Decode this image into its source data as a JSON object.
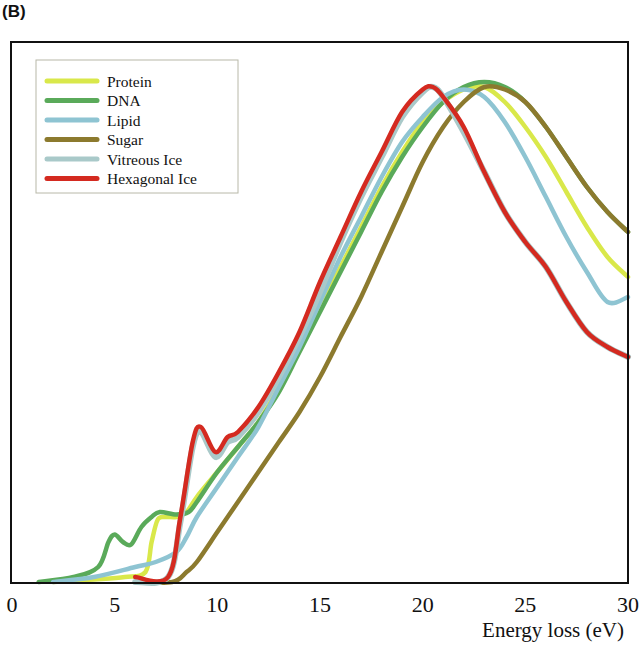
{
  "panel_label": "(B)",
  "chart_data": {
    "type": "line",
    "title": "",
    "xlabel": "Energy loss (eV)",
    "ylabel": "",
    "xlim": [
      0,
      30
    ],
    "ylim": [
      0,
      1.08
    ],
    "xticks": [
      0,
      5,
      10,
      15,
      20,
      25,
      30
    ],
    "xtick_labels": [
      "0",
      "5",
      "10",
      "15",
      "20",
      "25",
      "30"
    ],
    "yticks_shown": false,
    "grid": false,
    "legend_position": "upper left",
    "series": [
      {
        "name": "Protein",
        "color": "#d9e84a",
        "x": [
          2.0,
          4.0,
          5.5,
          6.5,
          6.8,
          7.1,
          7.5,
          8.0,
          8.5,
          9.0,
          10.0,
          11.0,
          12.0,
          13.0,
          14.0,
          15.0,
          16.0,
          17.0,
          18.0,
          19.0,
          20.0,
          21.0,
          22.0,
          23.0,
          24.0,
          25.0,
          26.0,
          27.0,
          28.0,
          29.0,
          30.0
        ],
        "y": [
          0.0,
          0.005,
          0.01,
          0.02,
          0.08,
          0.125,
          0.13,
          0.13,
          0.14,
          0.17,
          0.22,
          0.27,
          0.32,
          0.39,
          0.47,
          0.55,
          0.63,
          0.71,
          0.79,
          0.86,
          0.92,
          0.96,
          0.985,
          0.99,
          0.96,
          0.91,
          0.85,
          0.78,
          0.71,
          0.65,
          0.61
        ]
      },
      {
        "name": "DNA",
        "color": "#5aaa5a",
        "x": [
          1.3,
          3.0,
          4.2,
          4.7,
          5.0,
          5.4,
          5.8,
          6.3,
          6.8,
          7.2,
          8.0,
          8.6,
          9.0,
          10.0,
          11.0,
          12.0,
          13.0,
          14.0,
          15.0,
          16.0,
          17.0,
          18.0,
          19.0,
          20.0,
          21.0,
          22.0,
          23.0,
          24.0,
          25.0,
          26.0,
          27.0,
          28.0,
          29.0,
          30.0
        ],
        "y": [
          0.0,
          0.01,
          0.03,
          0.08,
          0.095,
          0.08,
          0.075,
          0.11,
          0.13,
          0.14,
          0.135,
          0.14,
          0.16,
          0.22,
          0.27,
          0.32,
          0.38,
          0.46,
          0.54,
          0.62,
          0.7,
          0.78,
          0.85,
          0.91,
          0.96,
          0.99,
          1.0,
          0.99,
          0.96,
          0.91,
          0.85,
          0.79,
          0.74,
          0.7
        ]
      },
      {
        "name": "Lipid",
        "color": "#8ec4d2",
        "x": [
          2.0,
          4.0,
          6.0,
          7.0,
          8.0,
          8.5,
          9.0,
          10.0,
          11.0,
          12.0,
          13.0,
          14.0,
          15.0,
          16.0,
          17.0,
          18.0,
          19.0,
          20.0,
          21.0,
          22.0,
          23.0,
          24.0,
          25.0,
          26.0,
          27.0,
          28.0,
          29.0,
          30.0
        ],
        "y": [
          0.0,
          0.01,
          0.03,
          0.04,
          0.06,
          0.09,
          0.13,
          0.19,
          0.25,
          0.31,
          0.39,
          0.47,
          0.56,
          0.65,
          0.73,
          0.81,
          0.88,
          0.93,
          0.97,
          0.985,
          0.97,
          0.92,
          0.85,
          0.77,
          0.69,
          0.62,
          0.56,
          0.57
        ]
      },
      {
        "name": "Sugar",
        "color": "#8c7a2e",
        "x": [
          6.0,
          7.8,
          8.5,
          9.0,
          10.0,
          11.0,
          12.0,
          13.0,
          14.0,
          15.0,
          16.0,
          17.0,
          18.0,
          19.0,
          20.0,
          21.0,
          22.0,
          23.0,
          24.0,
          25.0,
          26.0,
          27.0,
          28.0,
          29.0,
          30.0
        ],
        "y": [
          0.0,
          0.0,
          0.02,
          0.04,
          0.1,
          0.16,
          0.22,
          0.28,
          0.34,
          0.41,
          0.49,
          0.57,
          0.66,
          0.75,
          0.84,
          0.91,
          0.96,
          0.99,
          0.985,
          0.96,
          0.91,
          0.85,
          0.79,
          0.74,
          0.7
        ]
      },
      {
        "name": "Vitreous Ice",
        "color": "#a9c9c9",
        "x": [
          6.0,
          7.6,
          8.2,
          8.8,
          9.2,
          9.9,
          10.5,
          11.0,
          12.0,
          13.0,
          14.0,
          15.0,
          16.0,
          17.0,
          18.0,
          19.0,
          20.0,
          20.5,
          21.0,
          22.0,
          23.0,
          24.0,
          25.0,
          26.0,
          27.0,
          28.0,
          29.0,
          30.0
        ],
        "y": [
          0.0,
          0.01,
          0.12,
          0.27,
          0.3,
          0.25,
          0.28,
          0.29,
          0.34,
          0.41,
          0.49,
          0.58,
          0.68,
          0.77,
          0.85,
          0.93,
          0.98,
          0.99,
          0.97,
          0.9,
          0.82,
          0.74,
          0.68,
          0.63,
          0.56,
          0.5,
          0.47,
          0.45
        ]
      },
      {
        "name": "Hexagonal Ice",
        "color": "#d42a20",
        "x": [
          6.0,
          7.6,
          8.2,
          8.8,
          9.2,
          9.9,
          10.5,
          11.0,
          12.0,
          13.0,
          14.0,
          15.0,
          16.0,
          17.0,
          18.0,
          19.0,
          20.0,
          20.5,
          21.0,
          22.0,
          23.0,
          24.0,
          25.0,
          26.0,
          27.0,
          28.0,
          29.0,
          30.0
        ],
        "y": [
          0.01,
          0.01,
          0.13,
          0.28,
          0.31,
          0.26,
          0.29,
          0.3,
          0.35,
          0.42,
          0.5,
          0.6,
          0.69,
          0.78,
          0.86,
          0.94,
          0.985,
          0.99,
          0.97,
          0.91,
          0.82,
          0.74,
          0.68,
          0.63,
          0.56,
          0.5,
          0.47,
          0.45
        ]
      }
    ]
  }
}
